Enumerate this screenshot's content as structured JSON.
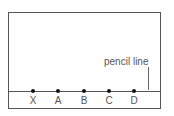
{
  "diagram": {
    "annotation": "pencil line",
    "points": [
      {
        "label": "X",
        "x": 33
      },
      {
        "label": "A",
        "x": 58
      },
      {
        "label": "B",
        "x": 84
      },
      {
        "label": "C",
        "x": 109
      },
      {
        "label": "D",
        "x": 134
      }
    ]
  }
}
